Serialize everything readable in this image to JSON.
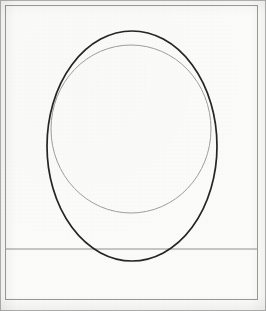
{
  "document": {
    "kind": "technical-drawing-scan",
    "title": "Ellipse and circle construction drawing",
    "page_width": 266,
    "page_height": 311
  },
  "colors": {
    "paper": "#fcfcfb",
    "paper_inner": "#fbfbf9",
    "frame_stroke": "#9a9a9a",
    "ellipse_stroke": "#262626",
    "circle_stroke": "#9e9e9e",
    "baseline_stroke": "#8f8f8f",
    "page_edge": "#b5b5b5"
  },
  "frame": {
    "label": "page border",
    "x": 5.5,
    "y": 5.5,
    "width": 252,
    "height": 294,
    "stroke_width": 1
  },
  "baseline": {
    "label": "horizontal ground line",
    "x1": 6,
    "y1": 249,
    "x2": 257,
    "y2": 249,
    "stroke_width": 1
  },
  "shapes": [
    {
      "name": "major-ellipse",
      "type": "ellipse",
      "cx": 132,
      "cy": 146,
      "rx": 85,
      "ry": 115,
      "stroke_width": 1.7,
      "tone": "dark"
    },
    {
      "name": "inscribed-circle",
      "type": "circle",
      "cx": 131,
      "cy": 129,
      "rx": 80,
      "ry": 84,
      "stroke_width": 1.0,
      "tone": "light"
    }
  ],
  "measurements": {
    "ellipse_top_y": 31,
    "ellipse_bottom_y": 261,
    "ellipse_left_x": 47,
    "ellipse_right_x": 217,
    "circle_top_y": 45,
    "circle_bottom_y": 213,
    "circle_left_x": 51,
    "circle_right_x": 211
  }
}
